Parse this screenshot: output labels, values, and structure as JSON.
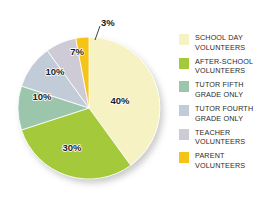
{
  "chart_data": {
    "type": "pie",
    "title": "",
    "subtitle": "",
    "xlabel": "",
    "ylabel": "",
    "legend_position": "right",
    "grid": false,
    "start_angle_deg": 0,
    "direction": "clockwise",
    "categories": [
      "SCHOOL DAY VOLUNTEERS",
      "AFTER-SCHOOL VOLUNTEERS",
      "TUTOR FIFTH GRADE ONLY",
      "TUTOR FOURTH GRADE ONLY",
      "TEACHER VOLUNTEERS",
      "PARENT VOLUNTEERS"
    ],
    "values": [
      40,
      30,
      10,
      10,
      7,
      3
    ],
    "value_labels": [
      "40%",
      "30%",
      "10%",
      "10%",
      "7%",
      "3%"
    ],
    "colors": [
      "#F7F2C4",
      "#A4C93A",
      "#9CC6AC",
      "#C2CCD8",
      "#CFCBD6",
      "#F6C417"
    ],
    "slices": [
      {
        "label": "SCHOOL DAY VOLUNTEERS",
        "value": 40,
        "value_label": "40%",
        "color": "#F7F2C4",
        "label_placement": "inside"
      },
      {
        "label": "AFTER-SCHOOL VOLUNTEERS",
        "value": 30,
        "value_label": "30%",
        "color": "#A4C93A",
        "label_placement": "inside"
      },
      {
        "label": "TUTOR FIFTH GRADE ONLY",
        "value": 10,
        "value_label": "10%",
        "color": "#9CC6AC",
        "label_placement": "inside"
      },
      {
        "label": "TUTOR FOURTH GRADE ONLY",
        "value": 10,
        "value_label": "10%",
        "color": "#C2CCD8",
        "label_placement": "inside"
      },
      {
        "label": "TEACHER VOLUNTEERS",
        "value": 7,
        "value_label": "7%",
        "color": "#CFCBD6",
        "label_placement": "inside"
      },
      {
        "label": "PARENT VOLUNTEERS",
        "value": 3,
        "value_label": "3%",
        "color": "#F6C417",
        "label_placement": "callout"
      }
    ]
  },
  "legend": {
    "items": [
      {
        "label": "SCHOOL DAY\nVOLUNTEERS",
        "color": "#F7F2C4"
      },
      {
        "label": "AFTER-SCHOOL\nVOLUNTEERS",
        "color": "#A4C93A"
      },
      {
        "label": "TUTOR FIFTH\nGRADE ONLY",
        "color": "#9CC6AC"
      },
      {
        "label": "TUTOR FOURTH\nGRADE ONLY",
        "color": "#C2CCD8"
      },
      {
        "label": "TEACHER\nVOLUNTEERS",
        "color": "#CFCBD6"
      },
      {
        "label": "PARENT\nVOLUNTEERS",
        "color": "#F6C417"
      }
    ]
  },
  "slice_value_labels": {
    "s0": "40%",
    "s1": "30%",
    "s2": "10%",
    "s3": "10%",
    "s4": "7%",
    "s5": "3%"
  }
}
